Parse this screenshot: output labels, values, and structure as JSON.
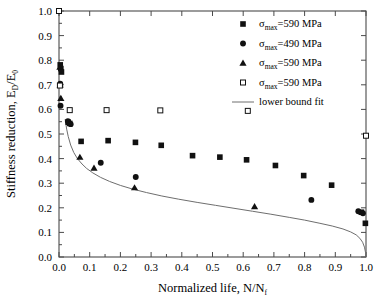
{
  "chart_data": {
    "type": "scatter",
    "title": "",
    "xlabel": "Normalized life, N/Nf",
    "ylabel": "Stiffness reduction, ED/E0",
    "xlabel_parts": {
      "pre": "Normalized life, N/N",
      "sub": "f"
    },
    "ylabel_parts": {
      "pre": "Stiffness reduction, E",
      "sub1": "D",
      "mid": "/E",
      "sub2": "0"
    },
    "xlim": [
      0.0,
      1.0
    ],
    "ylim": [
      0.0,
      1.0
    ],
    "grid": false,
    "legend_position": "top-right",
    "xticks": [
      "0.0",
      "0.1",
      "0.2",
      "0.3",
      "0.4",
      "0.5",
      "0.6",
      "0.7",
      "0.8",
      "0.9",
      "1.0"
    ],
    "xtick_values": [
      0.0,
      0.1,
      0.2,
      0.3,
      0.4,
      0.5,
      0.6,
      0.7,
      0.8,
      0.9,
      1.0
    ],
    "yticks": [
      "0.0",
      "0.1",
      "0.2",
      "0.3",
      "0.4",
      "0.5",
      "0.6",
      "0.7",
      "0.8",
      "0.9",
      "1.0"
    ],
    "ytick_values": [
      0.0,
      0.1,
      0.2,
      0.3,
      0.4,
      0.5,
      0.6,
      0.7,
      0.8,
      0.9,
      1.0
    ],
    "series": [
      {
        "name": "sigma_max=590 MPa (filled square)",
        "legend_pre": "σ",
        "legend_sub": "max",
        "legend_post": "=590 MPa",
        "marker": "filled-square",
        "color": "#111111",
        "points": [
          [
            0.004,
            0.781
          ],
          [
            0.006,
            0.766
          ],
          [
            0.008,
            0.752
          ],
          [
            0.03,
            0.548
          ],
          [
            0.035,
            0.543
          ],
          [
            0.072,
            0.47
          ],
          [
            0.16,
            0.473
          ],
          [
            0.249,
            0.466
          ],
          [
            0.333,
            0.454
          ],
          [
            0.435,
            0.412
          ],
          [
            0.524,
            0.406
          ],
          [
            0.611,
            0.395
          ],
          [
            0.705,
            0.372
          ],
          [
            0.797,
            0.331
          ],
          [
            0.888,
            0.292
          ],
          [
            0.985,
            0.182
          ],
          [
            0.998,
            0.137
          ]
        ]
      },
      {
        "name": "sigma_max=490 MPa (filled circle)",
        "legend_pre": "σ",
        "legend_sub": "max",
        "legend_post": "=490 MPa",
        "marker": "filled-circle",
        "color": "#111111",
        "points": [
          [
            0.004,
            0.705
          ],
          [
            0.005,
            0.615
          ],
          [
            0.029,
            0.552
          ],
          [
            0.038,
            0.54
          ],
          [
            0.136,
            0.383
          ],
          [
            0.25,
            0.325
          ],
          [
            0.822,
            0.232
          ],
          [
            0.975,
            0.186
          ],
          [
            0.99,
            0.178
          ]
        ]
      },
      {
        "name": "sigma_max=590 MPa (filled triangle)",
        "legend_pre": "σ",
        "legend_sub": "max",
        "legend_post": "=590 MPa",
        "marker": "filled-triangle",
        "color": "#111111",
        "points": [
          [
            0.003,
            0.772
          ],
          [
            0.004,
            0.7
          ],
          [
            0.006,
            0.645
          ],
          [
            0.068,
            0.406
          ],
          [
            0.114,
            0.362
          ],
          [
            0.246,
            0.282
          ],
          [
            0.637,
            0.205
          ]
        ]
      },
      {
        "name": "sigma_max=590 MPa (open square)",
        "legend_pre": "σ",
        "legend_sub": "max",
        "legend_post": "=590 MPa",
        "marker": "open-square",
        "color": "#111111",
        "points": [
          [
            0.0,
            1.0
          ],
          [
            0.003,
            0.697
          ],
          [
            0.035,
            0.597
          ],
          [
            0.155,
            0.597
          ],
          [
            0.33,
            0.596
          ],
          [
            0.615,
            0.594
          ],
          [
            1.0,
            0.493
          ]
        ]
      }
    ],
    "fit": {
      "name": "lower bound fit",
      "label": "lower bound fit",
      "color": "#6e6e6e",
      "points": [
        [
          0.02,
          0.56
        ],
        [
          0.025,
          0.52
        ],
        [
          0.03,
          0.49
        ],
        [
          0.038,
          0.455
        ],
        [
          0.048,
          0.425
        ],
        [
          0.06,
          0.4
        ],
        [
          0.075,
          0.378
        ],
        [
          0.09,
          0.36
        ],
        [
          0.11,
          0.342
        ],
        [
          0.135,
          0.324
        ],
        [
          0.165,
          0.307
        ],
        [
          0.2,
          0.291
        ],
        [
          0.24,
          0.276
        ],
        [
          0.285,
          0.262
        ],
        [
          0.335,
          0.248
        ],
        [
          0.39,
          0.235
        ],
        [
          0.45,
          0.222
        ],
        [
          0.51,
          0.21
        ],
        [
          0.57,
          0.198
        ],
        [
          0.63,
          0.186
        ],
        [
          0.69,
          0.174
        ],
        [
          0.75,
          0.161
        ],
        [
          0.8,
          0.15
        ],
        [
          0.85,
          0.137
        ],
        [
          0.89,
          0.126
        ],
        [
          0.925,
          0.114
        ],
        [
          0.95,
          0.102
        ],
        [
          0.968,
          0.09
        ],
        [
          0.98,
          0.076
        ],
        [
          0.989,
          0.06
        ],
        [
          0.995,
          0.04
        ],
        [
          0.999,
          0.015
        ],
        [
          1.0,
          0.0
        ]
      ]
    }
  },
  "legend": {
    "entries": [
      {
        "marker": "filled-square",
        "pre": "σ",
        "sub": "max",
        "post": "=590 MPa"
      },
      {
        "marker": "filled-circle",
        "pre": "σ",
        "sub": "max",
        "post": "=490 MPa"
      },
      {
        "marker": "filled-triangle",
        "pre": "σ",
        "sub": "max",
        "post": "=590 MPa"
      },
      {
        "marker": "open-square",
        "pre": "σ",
        "sub": "max",
        "post": "=590 MPa"
      },
      {
        "marker": "line",
        "pre": "",
        "sub": "",
        "post": "lower bound fit"
      }
    ]
  },
  "colors": {
    "marker": "#111111",
    "fit_line": "#6e6e6e",
    "axis": "#4a4a4a",
    "background": "#ffffff"
  }
}
